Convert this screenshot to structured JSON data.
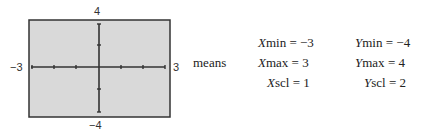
{
  "graph": {
    "x_min_label": "−3",
    "x_max_label": "3",
    "y_max_label": "4",
    "y_min_label": "−4",
    "fill_color": "#d9d9d9",
    "x_range": [
      -3,
      3
    ],
    "y_range": [
      -4,
      4
    ],
    "x_ticks": [
      -3,
      -2,
      -1,
      1,
      2,
      3
    ],
    "y_ticks": [
      -4,
      -2,
      2,
      4
    ]
  },
  "means_label": "means",
  "settings": [
    {
      "var": "X",
      "name": "min",
      "value": "−3"
    },
    {
      "var": "Y",
      "name": "min",
      "value": "−4"
    },
    {
      "var": "X",
      "name": "max",
      "value": "3"
    },
    {
      "var": "Y",
      "name": "max",
      "value": "4"
    },
    {
      "var": "X",
      "name": "scl",
      "value": "1"
    },
    {
      "var": "Y",
      "name": "scl",
      "value": "2"
    }
  ]
}
